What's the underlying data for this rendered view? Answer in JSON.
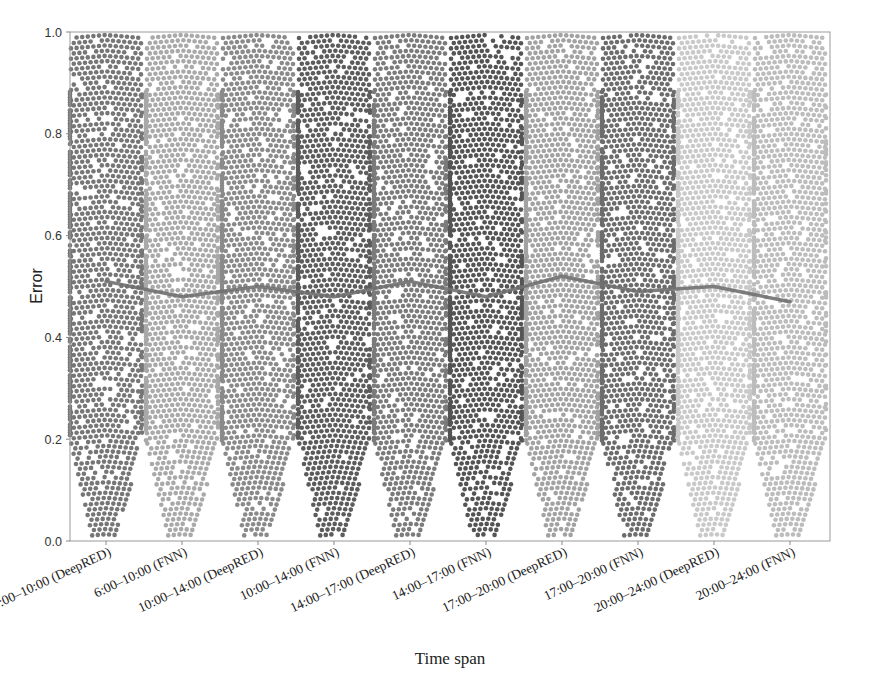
{
  "chart_data": {
    "type": "scatter",
    "subtype": "swarm_with_mean_line",
    "title": "",
    "xlabel": "Time span",
    "ylabel": "Error",
    "ylim": [
      0.0,
      1.0
    ],
    "yticks": [
      "0.0",
      "0.2",
      "0.4",
      "0.6",
      "0.8",
      "1.0"
    ],
    "grid": false,
    "legend": null,
    "categories": [
      "6:00–10:00 (DeepRED)",
      "6:00–10:00 (FNN)",
      "10:00–14:00 (DeepRED)",
      "10:00–14:00 (FNN)",
      "14:00–17:00 (DeepRED)",
      "14:00–17:00 (FNN)",
      "17:00–20:00 (DeepRED)",
      "17:00–20:00 (FNN)",
      "20:00–24:00 (DeepRED)",
      "20:00–24:00 (FNN)"
    ],
    "series": [
      {
        "name": "mean error",
        "type": "line",
        "color": "#707070",
        "values": [
          0.51,
          0.48,
          0.5,
          0.48,
          0.51,
          0.48,
          0.52,
          0.49,
          0.5,
          0.47
        ]
      }
    ],
    "swarm_colors": [
      "#767676",
      "#a9a9a9",
      "#8a8a8a",
      "#5c5c5c",
      "#7b7b7b",
      "#545454",
      "#a2a2a2",
      "#6c6c6c",
      "#c9c9c9",
      "#bcbcbc"
    ],
    "swarm_distribution": "approximately uniform in [0, 1], narrowing near 0"
  }
}
